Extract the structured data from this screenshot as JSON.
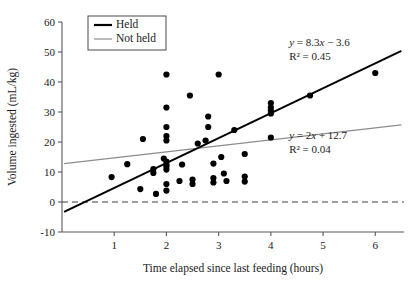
{
  "chart_data": {
    "type": "scatter",
    "title": "",
    "xlabel": "Time elapsed since last feeding (hours)",
    "ylabel": "Volume ingested (mL/kg)",
    "xlim": [
      0,
      6.55
    ],
    "ylim": [
      -10,
      60
    ],
    "xticks": [
      1,
      2,
      3,
      4,
      5,
      6
    ],
    "yticks": [
      -10,
      0,
      10,
      20,
      30,
      40,
      50,
      60
    ],
    "grid": false,
    "legend_position": "top-center",
    "legend": [
      "Held",
      "Not held"
    ],
    "series": [
      {
        "name": "Held",
        "color": "#000000",
        "fit_label_eq": "y = 8.3x − 3.6",
        "fit_label_r2": "R² = 0.45",
        "slope": 8.3,
        "intercept": -3.6,
        "r_squared": 0.45,
        "points": [
          [
            0.95,
            8.3
          ],
          [
            1.25,
            12.6
          ],
          [
            1.5,
            4.3
          ],
          [
            1.55,
            21.0
          ],
          [
            1.75,
            9.7
          ],
          [
            1.75,
            11.0
          ],
          [
            1.8,
            2.7
          ],
          [
            1.95,
            14.5
          ],
          [
            2.0,
            13.5
          ],
          [
            2.0,
            12.5
          ],
          [
            2.0,
            11.8
          ],
          [
            2.0,
            10.8
          ],
          [
            2.0,
            20.5
          ],
          [
            2.0,
            22.0
          ],
          [
            2.0,
            25.0
          ],
          [
            2.0,
            31.5
          ],
          [
            2.0,
            42.5
          ],
          [
            2.0,
            6.0
          ],
          [
            2.0,
            3.8
          ],
          [
            2.25,
            7.0
          ],
          [
            2.3,
            12.5
          ],
          [
            2.45,
            35.5
          ],
          [
            2.5,
            7.5
          ],
          [
            2.5,
            6.0
          ],
          [
            2.6,
            19.5
          ],
          [
            2.75,
            20.5
          ],
          [
            2.8,
            25.0
          ],
          [
            2.8,
            28.5
          ],
          [
            2.9,
            12.8
          ],
          [
            2.9,
            8.0
          ],
          [
            2.9,
            6.5
          ],
          [
            3.0,
            42.5
          ],
          [
            3.05,
            15.0
          ],
          [
            3.1,
            9.5
          ],
          [
            3.15,
            7.0
          ],
          [
            3.3,
            24.0
          ],
          [
            3.5,
            16.0
          ],
          [
            3.5,
            8.5
          ],
          [
            3.5,
            6.8
          ],
          [
            4.0,
            29.5
          ],
          [
            4.0,
            30.5
          ],
          [
            4.0,
            31.5
          ],
          [
            4.0,
            33.0
          ],
          [
            4.0,
            21.5
          ],
          [
            4.75,
            35.5
          ],
          [
            6.0,
            43.0
          ]
        ]
      },
      {
        "name": "Not held",
        "color": "#8c8c8e",
        "fit_label_eq": "y = 2x + 12.7",
        "fit_label_r2": "R² = 0.04",
        "slope": 2.0,
        "intercept": 12.7,
        "r_squared": 0.04,
        "points": []
      }
    ],
    "reference_line": {
      "y": 0,
      "style": "dashed",
      "color": "#3d3d3f"
    },
    "annotations": [
      {
        "text": "y = 8.3x − 3.6",
        "x": 4.35,
        "y": 52.0
      },
      {
        "text": "R² = 0.45",
        "x": 4.35,
        "y": 47.5
      },
      {
        "text": "y = 2x + 12.7",
        "x": 4.35,
        "y": 21.0
      },
      {
        "text": "R² = 0.04",
        "x": 4.35,
        "y": 16.5
      }
    ]
  }
}
